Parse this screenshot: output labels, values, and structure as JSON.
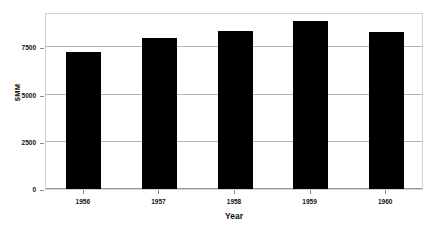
{
  "chart_data": {
    "type": "bar",
    "title": "",
    "xlabel": "Year",
    "ylabel": "$MM",
    "categories": [
      "1956",
      "1957",
      "1958",
      "1959",
      "1960"
    ],
    "values": [
      7270,
      8000,
      8380,
      8900,
      8300
    ],
    "ylim": [
      0,
      9375
    ],
    "yticks": [
      0,
      2500,
      5000,
      7500
    ],
    "ytick_labels": [
      "0",
      "2500",
      "5000",
      "7500"
    ],
    "grid": true,
    "legend": false,
    "legend_position": "none",
    "bar_color": "#000000",
    "gridline_color": "#b5b5b5",
    "frame_color": "#d2d2d2",
    "background_color": "#ffffff"
  },
  "axis": {
    "y_title": "$MM",
    "x_title": "Year"
  }
}
